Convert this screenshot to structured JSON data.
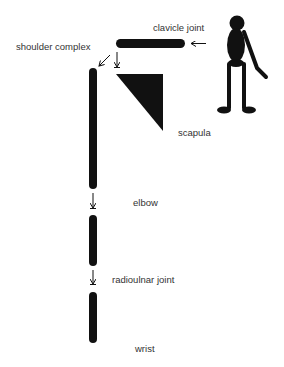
{
  "diagram": {
    "labels": {
      "clavicle_joint": "clavicle joint",
      "shoulder_complex": "shoulder complex",
      "scapula": "scapula",
      "elbow": "elbow",
      "radioulnar_joint": "radioulnar joint",
      "wrist": "wrist"
    },
    "segments": [
      {
        "id": "clavicle",
        "shape": "horizontal-rod"
      },
      {
        "id": "scapula",
        "shape": "triangle"
      },
      {
        "id": "upper-arm",
        "shape": "vertical-rod"
      },
      {
        "id": "forearm-proximal",
        "shape": "vertical-rod"
      },
      {
        "id": "forearm-distal",
        "shape": "vertical-rod"
      }
    ],
    "icons": {
      "figure": "stick-figure-icon",
      "arrow": "arrow-icon"
    },
    "colors": {
      "ink": "#111111",
      "text": "#333333",
      "background": "#ffffff"
    }
  }
}
